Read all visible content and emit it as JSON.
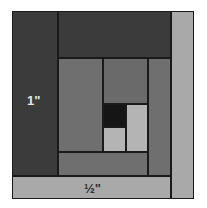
{
  "diagram": {
    "labels": {
      "wide_strip": "1\"",
      "narrow_strip": "½\""
    },
    "colors": {
      "dark": "#3b3b3b",
      "medium": "#6f6f6f",
      "medium_alt": "#6a6a6a",
      "light": "#a9a9a9",
      "center_dark": "#151515",
      "center_light": "#b4b4b4",
      "outline": "#1a1a1a",
      "label_on_dark": "#e6e6e6",
      "label_on_light": "#333333"
    },
    "pieces": [
      {
        "name": "left-outer-strip",
        "x": 12,
        "y": 11,
        "w": 46,
        "h": 165,
        "color": "dark"
      },
      {
        "name": "top-outer-strip",
        "x": 58,
        "y": 11,
        "w": 113,
        "h": 47,
        "color": "dark"
      },
      {
        "name": "right-outer-strip",
        "x": 171,
        "y": 11,
        "w": 23,
        "h": 188,
        "color": "light"
      },
      {
        "name": "bottom-outer-strip",
        "x": 12,
        "y": 176,
        "w": 159,
        "h": 23,
        "color": "light"
      },
      {
        "name": "inner-left-block",
        "x": 58,
        "y": 58,
        "w": 45,
        "h": 94,
        "color": "medium"
      },
      {
        "name": "inner-top-block",
        "x": 103,
        "y": 58,
        "w": 45,
        "h": 46,
        "color": "medium_alt"
      },
      {
        "name": "inner-right-strip",
        "x": 148,
        "y": 58,
        "w": 23,
        "h": 118,
        "color": "medium"
      },
      {
        "name": "inner-bottom-strip",
        "x": 58,
        "y": 152,
        "w": 90,
        "h": 24,
        "color": "medium"
      },
      {
        "name": "center-dark-square",
        "x": 103,
        "y": 104,
        "w": 23,
        "h": 23,
        "color": "center_dark"
      },
      {
        "name": "center-light-square",
        "x": 103,
        "y": 127,
        "w": 23,
        "h": 25,
        "color": "center_light"
      },
      {
        "name": "center-right-light",
        "x": 126,
        "y": 104,
        "w": 22,
        "h": 48,
        "color": "center_light"
      }
    ]
  }
}
